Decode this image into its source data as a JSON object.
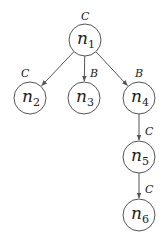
{
  "diagram": {
    "type": "tree",
    "nodes": [
      {
        "id": "n1",
        "base": "n",
        "sub": "1",
        "x": 85,
        "y": 40,
        "tag": "C",
        "tag_x": 85,
        "tag_y": 20
      },
      {
        "id": "n2",
        "base": "n",
        "sub": "2",
        "x": 30,
        "y": 98,
        "tag": "C",
        "tag_x": 25,
        "tag_y": 77
      },
      {
        "id": "n3",
        "base": "n",
        "sub": "3",
        "x": 84,
        "y": 98,
        "tag": null
      },
      {
        "id": "n4",
        "base": "n",
        "sub": "4",
        "x": 139,
        "y": 98,
        "tag": "B",
        "tag_x": 139,
        "tag_y": 77
      },
      {
        "id": "n5",
        "base": "n",
        "sub": "5",
        "x": 139,
        "y": 157,
        "tag": null
      },
      {
        "id": "n6",
        "base": "n",
        "sub": "6",
        "x": 139,
        "y": 215,
        "tag": null
      }
    ],
    "edges": [
      {
        "from": "n1",
        "to": "n2",
        "label": null
      },
      {
        "from": "n1",
        "to": "n3",
        "label": "B",
        "label_x": 90,
        "label_y": 77
      },
      {
        "from": "n1",
        "to": "n4",
        "label": null
      },
      {
        "from": "n4",
        "to": "n5",
        "label": "C",
        "label_x": 145,
        "label_y": 135
      },
      {
        "from": "n5",
        "to": "n6",
        "label": "C",
        "label_x": 145,
        "label_y": 193
      }
    ],
    "node_radius": 16
  }
}
